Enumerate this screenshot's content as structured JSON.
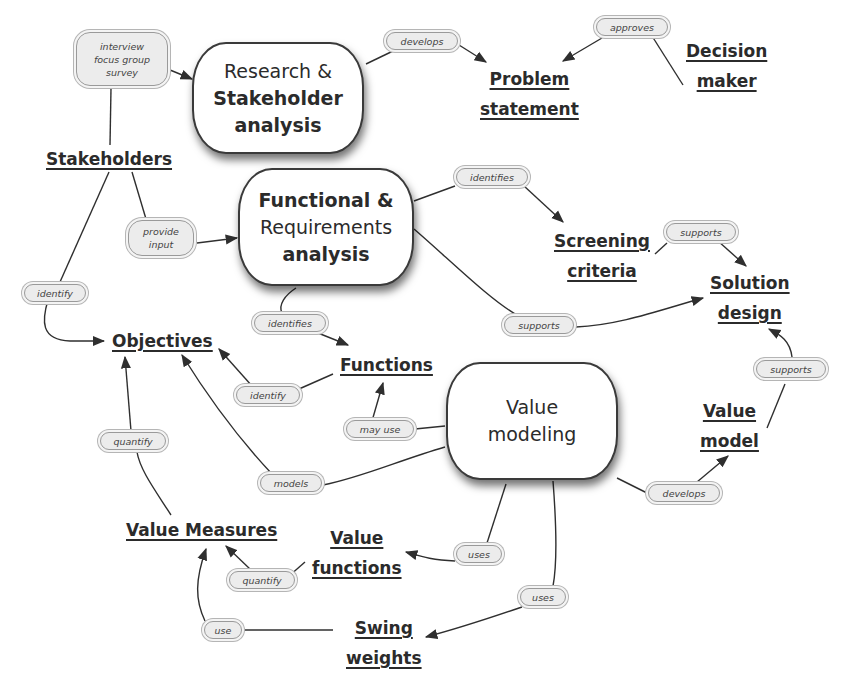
{
  "diagram": {
    "processes": [
      {
        "id": "research",
        "lines": [
          "Research &",
          "Stakeholder",
          "analysis"
        ]
      },
      {
        "id": "functional",
        "lines": [
          "Functional &",
          "Requirements",
          "analysis"
        ]
      },
      {
        "id": "value_modeling",
        "lines": [
          "Value",
          "modeling"
        ]
      }
    ],
    "concepts": [
      {
        "id": "stakeholders",
        "lines": [
          "Stakeholders"
        ]
      },
      {
        "id": "problem_statement",
        "lines": [
          "Problem",
          "statement"
        ]
      },
      {
        "id": "decision_maker",
        "lines": [
          "Decision",
          "maker"
        ]
      },
      {
        "id": "screening_criteria",
        "lines": [
          "Screening",
          "criteria"
        ]
      },
      {
        "id": "solution_design",
        "lines": [
          "Solution",
          "design"
        ]
      },
      {
        "id": "objectives",
        "lines": [
          "Objectives"
        ]
      },
      {
        "id": "functions",
        "lines": [
          "Functions"
        ]
      },
      {
        "id": "value_model",
        "lines": [
          "Value",
          "model"
        ]
      },
      {
        "id": "value_measures",
        "lines": [
          "Value Measures"
        ]
      },
      {
        "id": "value_functions",
        "lines": [
          "Value",
          "functions"
        ]
      },
      {
        "id": "swing_weights",
        "lines": [
          "Swing",
          "weights"
        ]
      }
    ],
    "link_labels": [
      {
        "id": "methods",
        "lines": [
          "interview",
          "focus group",
          "survey"
        ]
      },
      {
        "id": "develops_problem",
        "lines": [
          "develops"
        ]
      },
      {
        "id": "approves",
        "lines": [
          "approves"
        ]
      },
      {
        "id": "provide_input",
        "lines": [
          "provide",
          "input"
        ]
      },
      {
        "id": "identify_stakeholders",
        "lines": [
          "identify"
        ]
      },
      {
        "id": "identifies_criteria",
        "lines": [
          "identifies"
        ]
      },
      {
        "id": "supports_criteria",
        "lines": [
          "supports"
        ]
      },
      {
        "id": "supports_functional",
        "lines": [
          "supports"
        ]
      },
      {
        "id": "identifies_functions",
        "lines": [
          "identifies"
        ]
      },
      {
        "id": "identify_functions",
        "lines": [
          "identify"
        ]
      },
      {
        "id": "may_use",
        "lines": [
          "may use"
        ]
      },
      {
        "id": "quantify_objectives",
        "lines": [
          "quantify"
        ]
      },
      {
        "id": "models",
        "lines": [
          "models"
        ]
      },
      {
        "id": "supports_value_model",
        "lines": [
          "supports"
        ]
      },
      {
        "id": "develops_value_model",
        "lines": [
          "develops"
        ]
      },
      {
        "id": "uses_value_functions",
        "lines": [
          "uses"
        ]
      },
      {
        "id": "uses_swing_weights",
        "lines": [
          "uses"
        ]
      },
      {
        "id": "quantify_measures",
        "lines": [
          "quantify"
        ]
      },
      {
        "id": "use_swing",
        "lines": [
          "use"
        ]
      }
    ],
    "colors": {
      "line": "#2f2f2f",
      "cloud_fill": "#ececec",
      "cloud_border": "#9a9a9a",
      "background": "#ffffff"
    }
  }
}
